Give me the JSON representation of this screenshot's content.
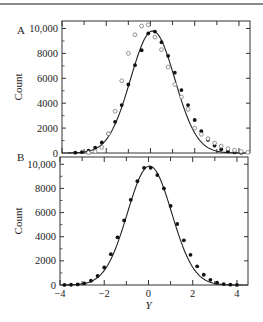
{
  "figure": {
    "panels": [
      "A",
      "B"
    ],
    "x_axis_label": "Y",
    "y_axis_label": "Count",
    "x_ticks": [
      "-4",
      "-2",
      "0",
      "2",
      "4"
    ],
    "y_ticks": [
      "0",
      "2000",
      "4000",
      "6000",
      "8000",
      "10,000"
    ]
  },
  "chart_data": [
    {
      "type": "scatter",
      "panel": "A",
      "title": "",
      "xlabel": "Y",
      "ylabel": "Count",
      "xlim": [
        -4,
        4.5
      ],
      "ylim": [
        0,
        10600
      ],
      "grid": false,
      "legend": null,
      "series": [
        {
          "name": "fitted normal curve",
          "style": "line",
          "mean": 0.1,
          "sd": 1.0,
          "peak": 9800
        },
        {
          "name": "filled points",
          "style": "filled-circle",
          "x": [
            -3.4,
            -3.1,
            -2.8,
            -2.5,
            -2.2,
            -1.9,
            -1.6,
            -1.3,
            -1.0,
            -0.7,
            -0.4,
            -0.1,
            0.2,
            0.5,
            0.8,
            1.1,
            1.4,
            1.7,
            2.0,
            2.3,
            2.6,
            2.9,
            3.2,
            3.5,
            3.8,
            4.1
          ],
          "y": [
            30,
            70,
            180,
            420,
            850,
            1550,
            2500,
            3850,
            5500,
            7050,
            8250,
            9600,
            9750,
            8900,
            7800,
            6450,
            5050,
            3850,
            2650,
            1750,
            1050,
            600,
            300,
            140,
            60,
            20
          ]
        },
        {
          "name": "open circles (skewed)",
          "style": "open-circle",
          "x": [
            -2.8,
            -2.5,
            -2.2,
            -1.9,
            -1.6,
            -1.3,
            -1.0,
            -0.7,
            -0.4,
            -0.1,
            0.2,
            0.5,
            0.8,
            1.1,
            1.4,
            1.7,
            2.0,
            2.3,
            2.6,
            2.9,
            3.2,
            3.5,
            3.8,
            4.1,
            4.4
          ],
          "y": [
            30,
            120,
            450,
            1550,
            3350,
            5800,
            8000,
            9500,
            10200,
            10300,
            9300,
            8300,
            6900,
            5500,
            4500,
            3500,
            2000,
            1500,
            1150,
            800,
            550,
            350,
            220,
            120,
            60
          ]
        }
      ]
    },
    {
      "type": "scatter",
      "panel": "B",
      "title": "",
      "xlabel": "Y",
      "ylabel": "Count",
      "xlim": [
        -4,
        4.5
      ],
      "ylim": [
        0,
        10600
      ],
      "grid": false,
      "legend": null,
      "series": [
        {
          "name": "fitted normal curve",
          "style": "line",
          "mean": 0.05,
          "sd": 1.0,
          "peak": 9850
        },
        {
          "name": "filled points",
          "style": "filled-circle",
          "x": [
            -3.8,
            -3.5,
            -3.2,
            -2.9,
            -2.6,
            -2.3,
            -2.0,
            -1.7,
            -1.4,
            -1.1,
            -0.8,
            -0.5,
            -0.2,
            0.1,
            0.4,
            0.7,
            1.0,
            1.3,
            1.6,
            1.9,
            2.2,
            2.5,
            2.8,
            3.1,
            3.4,
            3.7,
            4.0
          ],
          "y": [
            10,
            20,
            50,
            140,
            350,
            750,
            1450,
            2550,
            3950,
            5350,
            7050,
            8600,
            9700,
            9700,
            9100,
            8000,
            6550,
            5050,
            3700,
            2500,
            1550,
            850,
            430,
            190,
            80,
            30,
            10
          ]
        }
      ]
    }
  ]
}
